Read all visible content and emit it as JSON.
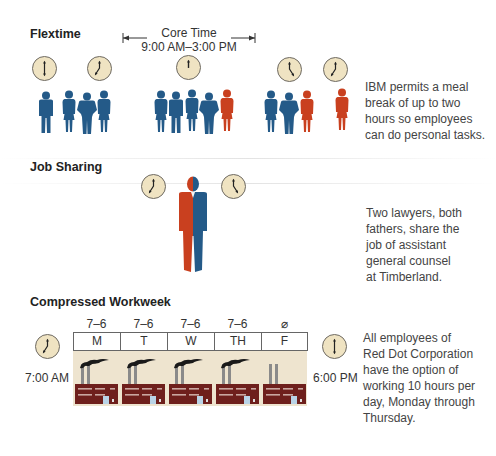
{
  "colors": {
    "blue": "#245a88",
    "red": "#c9401f",
    "clock_face": "#efe3c2",
    "factory": "#6e1f1c",
    "week_bg": "#eee4cf"
  },
  "flextime": {
    "title": "Flextime",
    "core_time": {
      "label": "Core Time",
      "range": "9:00 AM–3:00 PM"
    },
    "clocks": [
      "6:00",
      "7:00",
      "12:00",
      "5:00",
      "7:00"
    ],
    "groups": [
      {
        "people": [
          "blue",
          "blue",
          "blue",
          "blue"
        ]
      },
      {
        "people": [
          "blue",
          "blue",
          "blue",
          "blue",
          "red"
        ]
      },
      {
        "people": [
          "blue",
          "blue",
          "red"
        ]
      },
      {
        "people": [
          "red"
        ]
      }
    ],
    "description": [
      "IBM permits a meal",
      "break of up to two",
      "hours so employees",
      "can do personal tasks."
    ]
  },
  "job_sharing": {
    "title": "Job Sharing",
    "clocks": [
      "7:00",
      "5:00"
    ],
    "description": [
      "Two lawyers, both",
      "fathers, share the",
      "job of assistant",
      "general counsel",
      "at Timberland."
    ]
  },
  "compressed_workweek": {
    "title": "Compressed Workweek",
    "start_time": "7:00 AM",
    "end_time": "6:00 PM",
    "days": [
      {
        "day": "M",
        "hours": "7–6",
        "smoke": true
      },
      {
        "day": "T",
        "hours": "7–6",
        "smoke": true
      },
      {
        "day": "W",
        "hours": "7–6",
        "smoke": true
      },
      {
        "day": "TH",
        "hours": "7–6",
        "smoke": true
      },
      {
        "day": "F",
        "hours": "⌀",
        "smoke": false
      }
    ],
    "description": [
      "All employees of",
      "Red Dot Corporation",
      "have the option of",
      "working 10 hours per",
      "day, Monday through",
      "Thursday."
    ]
  }
}
